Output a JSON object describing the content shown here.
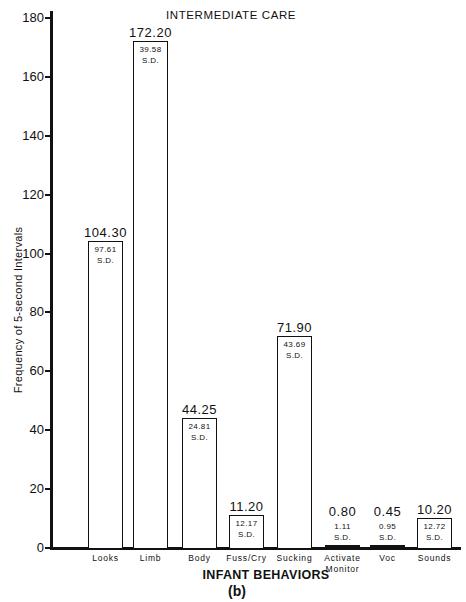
{
  "chart_data": {
    "type": "bar",
    "title": "INTERMEDIATE CARE",
    "xlabel": "INFANT BEHAVIORS",
    "ylabel": "Frequency of 5-second Intervals",
    "panel_label": "(b)",
    "ylim": [
      0,
      180
    ],
    "yticks": [
      0,
      20,
      40,
      60,
      80,
      100,
      120,
      140,
      160,
      180
    ],
    "categories": [
      "Looks",
      "Limb",
      "Body",
      "Fuss/Cry",
      "Sucking",
      "Activate Monitor",
      "Voc",
      "Sounds"
    ],
    "values": [
      104.3,
      172.2,
      44.25,
      11.2,
      71.9,
      0.8,
      0.45,
      10.2
    ],
    "sd": [
      97.61,
      39.58,
      24.81,
      12.17,
      43.69,
      1.11,
      0.95,
      12.72
    ],
    "sd_label": "S.D.",
    "value_labels": [
      "104.30",
      "172.20",
      "44.25",
      "11.20",
      "71.90",
      "0.80",
      "0.45",
      "10.20"
    ],
    "sd_labels": [
      "97.61",
      "39.58",
      "24.81",
      "12.17",
      "43.69",
      "1.11",
      "0.95",
      "12.72"
    ],
    "grid": false,
    "legend": null
  }
}
